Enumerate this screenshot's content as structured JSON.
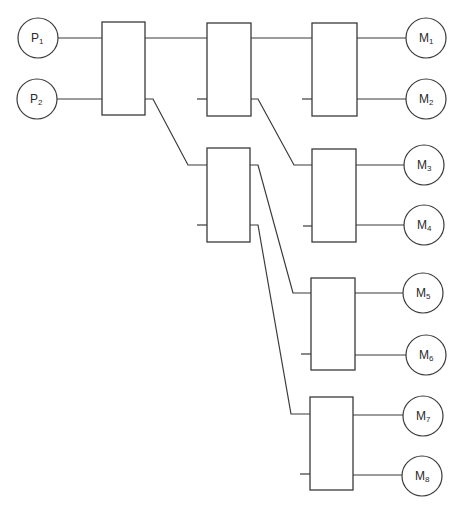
{
  "diagram": {
    "title": "",
    "line_color": "#3a3a3a",
    "inputs": [
      {
        "id": "P1",
        "label": "P",
        "sub": "1",
        "cx": 38,
        "cy": 38,
        "r": 20
      },
      {
        "id": "P2",
        "label": "P",
        "sub": "2",
        "cx": 37,
        "cy": 99,
        "r": 20
      }
    ],
    "outputs": [
      {
        "id": "M1",
        "label": "M",
        "sub": "1",
        "cx": 426,
        "cy": 38,
        "r": 20
      },
      {
        "id": "M2",
        "label": "M",
        "sub": "2",
        "cx": 426,
        "cy": 99,
        "r": 20
      },
      {
        "id": "M3",
        "label": "M",
        "sub": "3",
        "cx": 424,
        "cy": 165,
        "r": 20
      },
      {
        "id": "M4",
        "label": "M",
        "sub": "4",
        "cx": 424,
        "cy": 225,
        "r": 20
      },
      {
        "id": "M5",
        "label": "M",
        "sub": "5",
        "cx": 423,
        "cy": 293,
        "r": 20
      },
      {
        "id": "M6",
        "label": "M",
        "sub": "6",
        "cx": 426,
        "cy": 355,
        "r": 20
      },
      {
        "id": "M7",
        "label": "M",
        "sub": "7",
        "cx": 423,
        "cy": 416,
        "r": 20
      },
      {
        "id": "M8",
        "label": "M",
        "sub": "8",
        "cx": 422,
        "cy": 476,
        "r": 20
      }
    ],
    "switches": [
      {
        "id": "S1",
        "x": 102,
        "y": 22,
        "w": 43,
        "h": 93
      },
      {
        "id": "S2",
        "x": 207,
        "y": 23,
        "w": 44,
        "h": 93
      },
      {
        "id": "S3",
        "x": 312,
        "y": 23,
        "w": 45,
        "h": 93
      },
      {
        "id": "S4",
        "x": 207,
        "y": 148,
        "w": 43,
        "h": 94
      },
      {
        "id": "S5",
        "x": 312,
        "y": 149,
        "w": 44,
        "h": 93
      },
      {
        "id": "S6",
        "x": 311,
        "y": 278,
        "w": 44,
        "h": 92
      },
      {
        "id": "S7",
        "x": 310,
        "y": 397,
        "w": 43,
        "h": 93
      }
    ],
    "wires": [
      {
        "from": "P1-S1",
        "points": "58,38 102,38"
      },
      {
        "from": "P2-S1",
        "points": "57,99 102,99"
      },
      {
        "from": "S1-S2",
        "points": "145,38 207,38"
      },
      {
        "from": "S1-S4",
        "points": "145,99 153,99 188,165 207,165"
      },
      {
        "from": "S2-S3",
        "points": "251,38 312,38"
      },
      {
        "from": "S2-S5",
        "points": "251,99 258,99 294,165 312,165"
      },
      {
        "from": "S3-M1",
        "points": "357,38 406,38"
      },
      {
        "from": "S3-M2",
        "points": "357,99 406,99"
      },
      {
        "from": "S4-S6",
        "points": "250,165 258,165 293,293 311,293"
      },
      {
        "from": "S4-S7",
        "points": "250,225 258,225 291,414 310,414"
      },
      {
        "from": "S5-M3",
        "points": "356,165 404,165"
      },
      {
        "from": "S5-M4",
        "points": "356,225 404,225"
      },
      {
        "from": "S6-M5",
        "points": "355,293 403,293"
      },
      {
        "from": "S6-M6",
        "points": "355,355 406,355"
      },
      {
        "from": "S7-M7",
        "points": "353,415 403,415"
      },
      {
        "from": "S7-M8",
        "points": "353,475 402,475"
      }
    ],
    "stubs": [
      {
        "of": "S2",
        "points": "197,99 207,99"
      },
      {
        "of": "S3",
        "points": "302,99 312,99"
      },
      {
        "of": "S4",
        "points": "197,225 207,225"
      },
      {
        "of": "S5",
        "points": "303,226 312,226"
      },
      {
        "of": "S6",
        "points": "301,354 311,354"
      },
      {
        "of": "S7",
        "points": "300,474 310,474"
      }
    ]
  }
}
